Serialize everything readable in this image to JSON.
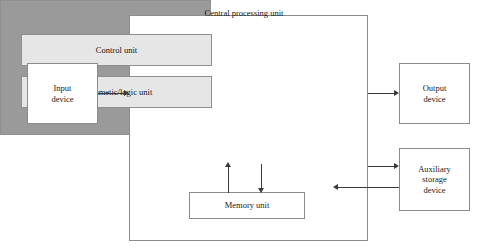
{
  "diagram": {
    "system_boundary": {
      "name": "computer-system"
    },
    "cpu": {
      "title": "Central processing unit",
      "units": [
        {
          "id": "control-unit",
          "label": "Control unit"
        },
        {
          "id": "arithmetic-logic-unit",
          "label": "Arithmetic/logic unit"
        }
      ]
    },
    "memory": {
      "label": "Memory unit"
    },
    "peripherals": [
      {
        "id": "input-device",
        "label": "Input\ndevice",
        "lines": [
          "Input",
          "device"
        ]
      },
      {
        "id": "output-device",
        "label": "Output\ndevice",
        "lines": [
          "Output",
          "device"
        ]
      },
      {
        "id": "auxiliary-storage-device",
        "label": "Auxiliary\nstorage\ndevice",
        "lines": [
          "Auxiliary",
          "storage",
          "device"
        ]
      }
    ],
    "connections": [
      {
        "from": "input-device",
        "to": "computer-system",
        "direction": "right"
      },
      {
        "from": "computer-system",
        "to": "output-device",
        "direction": "right"
      },
      {
        "from": "computer-system",
        "to": "auxiliary-storage-device",
        "direction": "right"
      },
      {
        "from": "auxiliary-storage-device",
        "to": "computer-system",
        "direction": "left"
      },
      {
        "from": "memory-unit",
        "to": "central-processing-unit",
        "direction": "up"
      },
      {
        "from": "central-processing-unit",
        "to": "memory-unit",
        "direction": "down"
      }
    ],
    "colors": {
      "cpu_fill": "#9a9a9a",
      "unit_fill": "#e6e6e6",
      "box_fill": "#ffffff",
      "border": "#8c8c8c",
      "connector": "#3a3a3a",
      "text": "#1a1a1a"
    },
    "labels": {
      "input_line_1": "Input",
      "input_line_2": "device",
      "output_line_1": "Output",
      "output_line_2": "device",
      "aux_line_1": "Auxiliary",
      "aux_line_2": "storage",
      "aux_line_3": "device"
    }
  }
}
